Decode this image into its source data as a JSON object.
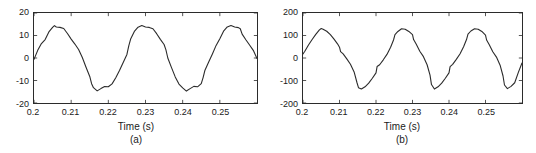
{
  "figure": {
    "background": "#ffffff",
    "line_color": "#2b2b2b",
    "axis_color": "#2b2b2b"
  },
  "chart_data": [
    {
      "type": "line",
      "title": "",
      "panel_label": "(a)",
      "xlabel": "Time (s)",
      "ylabel": "",
      "xlim": [
        0.2,
        0.26
      ],
      "ylim": [
        -20,
        20
      ],
      "xticks": [
        0.2,
        0.21,
        0.22,
        0.23,
        0.24,
        0.25
      ],
      "xticklabels": [
        "0.2",
        "0.21",
        "0.22",
        "0.23",
        "0.24",
        "0.25"
      ],
      "yticks": [
        20,
        10,
        0,
        -10,
        -20
      ],
      "yticklabels": [
        "20",
        "10",
        "0",
        "-10",
        "-20"
      ],
      "grid": false,
      "legend": null,
      "series": [
        {
          "name": "distorted-sine-a",
          "x": [
            0.2,
            0.201,
            0.202,
            0.203,
            0.204,
            0.205,
            0.2055,
            0.206,
            0.207,
            0.208,
            0.209,
            0.21,
            0.211,
            0.212,
            0.213,
            0.214,
            0.215,
            0.2155,
            0.216,
            0.217,
            0.218,
            0.219,
            0.22,
            0.221,
            0.222,
            0.223,
            0.224,
            0.225,
            0.2255,
            0.226,
            0.227,
            0.228,
            0.229,
            0.23,
            0.231,
            0.232,
            0.233,
            0.234,
            0.235,
            0.2355,
            0.236,
            0.237,
            0.238,
            0.239,
            0.24,
            0.241,
            0.242,
            0.243,
            0.244,
            0.245,
            0.2455,
            0.246,
            0.247,
            0.248,
            0.249,
            0.25,
            0.251,
            0.252,
            0.253,
            0.254,
            0.255,
            0.2555,
            0.256,
            0.257,
            0.258,
            0.259,
            0.26
          ],
          "y": [
            -0.6,
            3.4,
            6.4,
            8.2,
            11.6,
            13.6,
            14.4,
            13.8,
            13.6,
            13.1,
            10.9,
            8.4,
            6.2,
            3.8,
            0.2,
            -4.1,
            -8.2,
            -11.4,
            -13.2,
            -14.6,
            -13.6,
            -12.7,
            -12.8,
            -11.5,
            -8.8,
            -5.6,
            -2.0,
            1.6,
            5.4,
            8.4,
            11.8,
            13.7,
            14.4,
            13.8,
            13.6,
            13.0,
            10.8,
            8.3,
            6.0,
            3.6,
            0.0,
            -4.3,
            -8.4,
            -11.6,
            -13.3,
            -14.7,
            -13.6,
            -12.6,
            -12.8,
            -11.4,
            -8.7,
            -5.4,
            -1.8,
            1.8,
            5.6,
            8.6,
            11.9,
            13.8,
            14.4,
            13.8,
            13.5,
            13.0,
            10.6,
            8.1,
            5.8,
            3.4,
            -0.2
          ]
        }
      ]
    },
    {
      "type": "line",
      "title": "",
      "panel_label": "(b)",
      "xlabel": "Time (s)",
      "ylabel": "",
      "xlim": [
        0.2,
        0.26
      ],
      "ylim": [
        -200,
        200
      ],
      "xticks": [
        0.2,
        0.21,
        0.22,
        0.23,
        0.24,
        0.25
      ],
      "xticklabels": [
        "0.2",
        "0.21",
        "0.22",
        "0.23",
        "0.24",
        "0.25"
      ],
      "yticks": [
        200,
        100,
        0,
        -100,
        -200
      ],
      "yticklabels": [
        "200",
        "100",
        "0",
        "-100",
        "-200"
      ],
      "grid": false,
      "legend": null,
      "series": [
        {
          "name": "notched-triangular-b",
          "x": [
            0.2,
            0.2005,
            0.2015,
            0.2025,
            0.2035,
            0.2045,
            0.205,
            0.2055,
            0.2065,
            0.2075,
            0.2085,
            0.2095,
            0.21,
            0.2103,
            0.211,
            0.212,
            0.213,
            0.214,
            0.2148,
            0.2152,
            0.216,
            0.217,
            0.218,
            0.219,
            0.22,
            0.2203,
            0.221,
            0.222,
            0.223,
            0.224,
            0.2248,
            0.2252,
            0.226,
            0.227,
            0.228,
            0.229,
            0.23,
            0.2303,
            0.231,
            0.232,
            0.233,
            0.234,
            0.2348,
            0.2352,
            0.236,
            0.237,
            0.238,
            0.239,
            0.24,
            0.2403,
            0.241,
            0.242,
            0.243,
            0.244,
            0.2448,
            0.2452,
            0.246,
            0.247,
            0.248,
            0.249,
            0.25,
            0.2503,
            0.251,
            0.252,
            0.253,
            0.254,
            0.2548,
            0.2552,
            0.256,
            0.257,
            0.258,
            0.259,
            0.26
          ],
          "y": [
            18,
            30,
            58,
            82,
            105,
            125,
            131,
            128,
            119,
            104,
            84,
            62,
            48,
            28,
            18,
            -4,
            -28,
            -62,
            -110,
            -132,
            -138,
            -128,
            -112,
            -90,
            -66,
            -38,
            -30,
            -8,
            16,
            48,
            80,
            104,
            118,
            130,
            128,
            118,
            104,
            82,
            62,
            30,
            6,
            -30,
            -76,
            -118,
            -138,
            -128,
            -112,
            -90,
            -66,
            -38,
            -28,
            -6,
            18,
            50,
            82,
            106,
            120,
            130,
            128,
            118,
            102,
            80,
            60,
            28,
            4,
            -32,
            -80,
            -120,
            -136,
            -126,
            -110,
            -64,
            -22
          ]
        }
      ]
    }
  ]
}
